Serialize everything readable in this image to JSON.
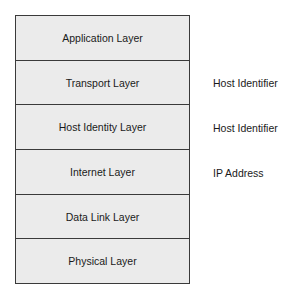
{
  "diagram": {
    "layers": [
      {
        "label": "Application Layer",
        "annotation": ""
      },
      {
        "label": "Transport Layer",
        "annotation": "Host Identifier"
      },
      {
        "label": "Host Identity Layer",
        "annotation": "Host Identifier"
      },
      {
        "label": "Internet Layer",
        "annotation": "IP Address"
      },
      {
        "label": "Data Link Layer",
        "annotation": ""
      },
      {
        "label": "Physical Layer",
        "annotation": ""
      }
    ]
  },
  "colors": {
    "layer_fill": "#ebebeb",
    "border": "#3a3a3a",
    "text": "#1a1a1a"
  }
}
